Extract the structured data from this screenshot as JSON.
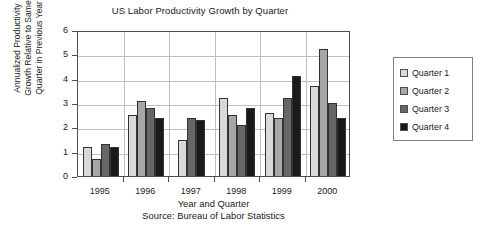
{
  "chart_data": {
    "type": "bar",
    "title": "US Labor Productivity Growth by Quarter",
    "xlabel": "Year and Quarter",
    "xlabel_source": "Source: Bureau of Labor Statistics",
    "ylabel_lines": [
      "Annualized Productivity",
      "Growth Relative to Same",
      "Quarter in Previous Year"
    ],
    "categories": [
      "1995",
      "1996",
      "1997",
      "1998",
      "1999",
      "2000"
    ],
    "ylim": [
      0,
      6
    ],
    "yticks": [
      0,
      1,
      2,
      3,
      4,
      5,
      6
    ],
    "ytick_labels": [
      "0",
      "1",
      "2",
      "3",
      "4",
      "5",
      "6"
    ],
    "grid": "horizontal-and-category-separators",
    "legend_position": "right",
    "series": [
      {
        "name": "Quarter 1",
        "color": "#d9d9d9",
        "values": [
          1.2,
          2.5,
          1.5,
          3.2,
          2.6,
          3.7
        ]
      },
      {
        "name": "Quarter 2",
        "color": "#a6a6a6",
        "values": [
          0.7,
          3.1,
          null,
          2.5,
          2.4,
          5.2
        ]
      },
      {
        "name": "Quarter 3",
        "color": "#666666",
        "values": [
          1.3,
          2.8,
          2.4,
          2.1,
          3.2,
          3.0
        ]
      },
      {
        "name": "Quarter 4",
        "color": "#1a1a1a",
        "values": [
          1.2,
          2.4,
          2.3,
          2.8,
          4.1,
          2.4
        ]
      }
    ]
  },
  "legend": {
    "items": [
      {
        "label": "Quarter 1",
        "color": "#d9d9d9"
      },
      {
        "label": "Quarter 2",
        "color": "#a6a6a6"
      },
      {
        "label": "Quarter 3",
        "color": "#666666"
      },
      {
        "label": "Quarter 4",
        "color": "#1a1a1a"
      }
    ]
  },
  "colors": {
    "axis": "#4d4d4d",
    "grid": "#bfbfbf",
    "text": "#1a1a1a",
    "bar_border": "#333333",
    "legend_border": "#808080",
    "background": "#ffffff"
  }
}
